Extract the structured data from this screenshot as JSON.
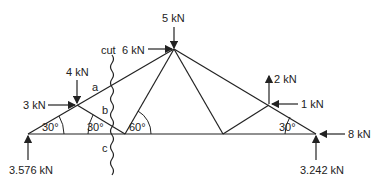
{
  "diagram": {
    "type": "truss free-body diagram with method-of-sections cut",
    "loads": {
      "apex_down": "5 kN",
      "apex_right": "6 kN",
      "left_node_down": "4 kN",
      "left_node_right": "3 kN",
      "right_node_up": "2 kN",
      "right_node_left": "1 kN",
      "right_support_left": "8 kN"
    },
    "reactions": {
      "left": "3.576 kN",
      "right": "3.242 kN"
    },
    "angles": {
      "left_support": "30°",
      "bottom_left_node": "30°",
      "bottom_mid_node": "60°",
      "right_support": "30°"
    },
    "cut": {
      "label": "cut",
      "members": [
        "a",
        "b",
        "c"
      ]
    }
  }
}
